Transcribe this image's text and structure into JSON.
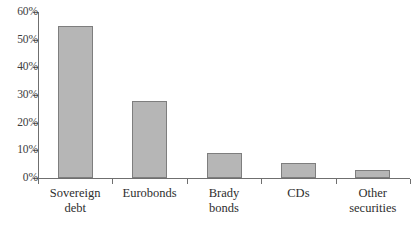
{
  "chart_data": {
    "type": "bar",
    "title": "",
    "subtitle": "",
    "xlabel": "",
    "ylabel": "",
    "categories": [
      "Sovereign debt",
      "Eurobonds",
      "Brady bonds",
      "CDs",
      "Other securities"
    ],
    "category_lines": [
      [
        "Sovereign",
        "debt"
      ],
      [
        "Eurobonds"
      ],
      [
        "Brady",
        "bonds"
      ],
      [
        "CDs"
      ],
      [
        "Other",
        "securities"
      ]
    ],
    "values": [
      55,
      28,
      9,
      5.5,
      3
    ],
    "ylim": [
      0,
      60
    ],
    "ytick_values": [
      0,
      10,
      20,
      30,
      40,
      50,
      60
    ],
    "ytick_labels": [
      "0%",
      "10%",
      "20%",
      "30%",
      "40%",
      "50%",
      "60%"
    ],
    "grid": false,
    "legend": false,
    "legend_position": "none",
    "bar_fill_color": "#b6b6b6",
    "bar_border_color": "#7e7e7e",
    "axis_color": "#6f6f6f",
    "text_color": "#2e2e2e"
  }
}
